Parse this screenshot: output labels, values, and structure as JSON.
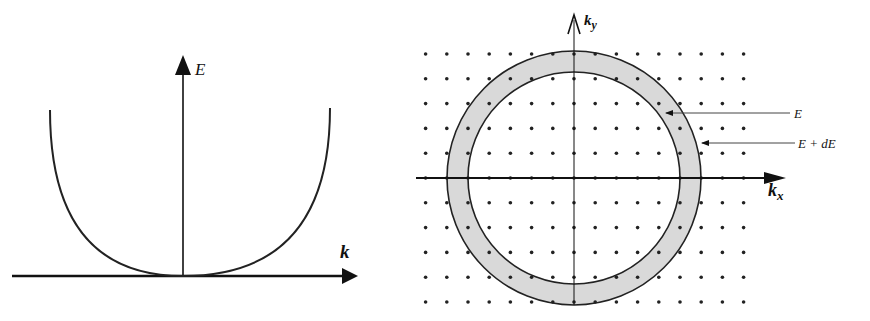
{
  "left_diagram": {
    "title": "Parabolic dispersion relation",
    "y_axis_label": "E",
    "x_axis_label": "k",
    "curve": "E ∝ k²"
  },
  "right_diagram": {
    "title": "Constant-energy shell in k-space",
    "x_axis_label": "k",
    "x_axis_subscript": "x",
    "y_axis_label": "k",
    "y_axis_subscript": "y",
    "inner_circle_label": "E",
    "outer_circle_label": "E + dE",
    "shell_fill": "#d9d9d9",
    "lattice": "square grid of allowed k-points"
  }
}
